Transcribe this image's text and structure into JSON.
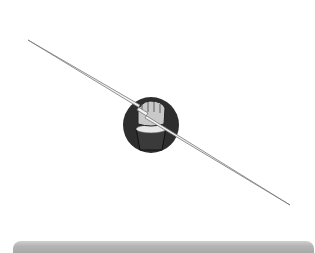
{
  "illustration": {
    "subject": "fist gripping lightning bolt",
    "icon": "fist-lightning-icon",
    "colors": {
      "circle": "#2e2e2e",
      "bolt": "#f2f2f2",
      "rays": "#8a8a8a",
      "sleeve": "#3a3a3a"
    }
  },
  "bottom_bar": {
    "color": "#b0b0b0"
  }
}
